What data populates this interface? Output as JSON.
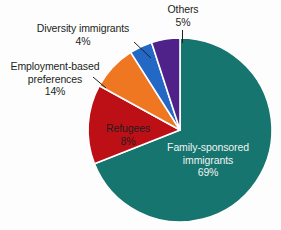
{
  "chart_data": {
    "type": "pie",
    "title": "",
    "categories": [
      "Family-sponsored immigrants",
      "Employment-based preferences",
      "Refugees",
      "Diversity immigrants",
      "Others"
    ],
    "values": [
      69,
      14,
      8,
      4,
      5
    ],
    "units": "%",
    "legend": "none",
    "start_angle_deg": 0,
    "direction": "clockwise",
    "colors": [
      "#16756e",
      "#bd1016",
      "#ef7722",
      "#2268c4",
      "#4f2289"
    ],
    "slices": [
      {
        "label": "Family-sponsored immigrants",
        "value": 69,
        "value_text": "69%",
        "color": "#16756e",
        "label_placement": "inside",
        "label_color": "#eef3f2"
      },
      {
        "label": "Employment-based preferences",
        "value": 14,
        "value_text": "14%",
        "color": "#bd1016",
        "label_placement": "outside-left",
        "label_color": "#231f20"
      },
      {
        "label": "Refugees",
        "value": 8,
        "value_text": "8%",
        "color": "#ef7722",
        "label_placement": "inside",
        "label_color": "#231f20"
      },
      {
        "label": "Diversity immigrants",
        "value": 4,
        "value_text": "4%",
        "color": "#2268c4",
        "label_placement": "outside-left",
        "label_color": "#231f20"
      },
      {
        "label": "Others",
        "value": 5,
        "value_text": "5%",
        "color": "#4f2289",
        "label_placement": "outside-top",
        "label_color": "#231f20"
      }
    ]
  },
  "labels": {
    "others": {
      "name": "Others",
      "pct": "5%"
    },
    "diversity": {
      "name": "Diversity immigrants",
      "pct": "4%"
    },
    "employment_line1": "Employment-based",
    "employment_line2": "preferences",
    "employment_pct": "14%",
    "refugees": {
      "name": "Refugees",
      "pct": "8%"
    },
    "family_line1": "Family-sponsored",
    "family_line2": "immigrants",
    "family_pct": "69%"
  },
  "colors": {
    "background": "#fdfdfe",
    "text": "#231f20",
    "slice_separator": "#ffffff",
    "inside_light_text": "#eef3f2"
  }
}
